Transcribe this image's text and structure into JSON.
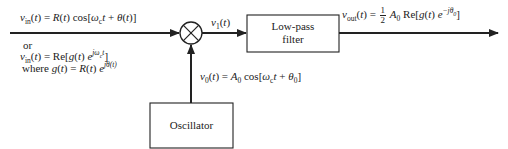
{
  "diagram": {
    "type": "block-diagram",
    "input": {
      "label_line1": "v_in(t) = R(t) cos[ω_c t + θ(t)]",
      "label_or": "or",
      "label_line2": "v_in(t) = Re[g(t) e^{jω_c t}]",
      "label_line3": "where g(t) = R(t) e^{jθ(t)}",
      "parts": {
        "v": "v",
        "in": "in",
        "t": "t",
        "eq": " = ",
        "R": "R",
        "cos": " cos[",
        "omega": "ω",
        "c": "c",
        "plus": " + ",
        "theta": "θ",
        "re": "Re[",
        "g": "g",
        "e": " e",
        "jomega": "jω",
        "ct": "c",
        "or": "or",
        "where": "where "
      }
    },
    "mixer": {
      "name": "multiplier",
      "symbol": "⊗"
    },
    "v1_label": "v1(t)",
    "lpf": {
      "line1": "Low-pass",
      "line2": "filter"
    },
    "oscillator": {
      "label": "Oscillator",
      "output_label": "v0(t) = A0 cos[ωc t + θ0]"
    },
    "output": {
      "label": "vout(t) = 1/2 A0 Re[g(t) e^{-jθ0}]"
    }
  },
  "text": {
    "or": "or",
    "where": "where",
    "lpf1": "Low-pass",
    "lpf2": "filter",
    "osc": "Oscillator",
    "half_num": "1",
    "half_den": "2"
  }
}
